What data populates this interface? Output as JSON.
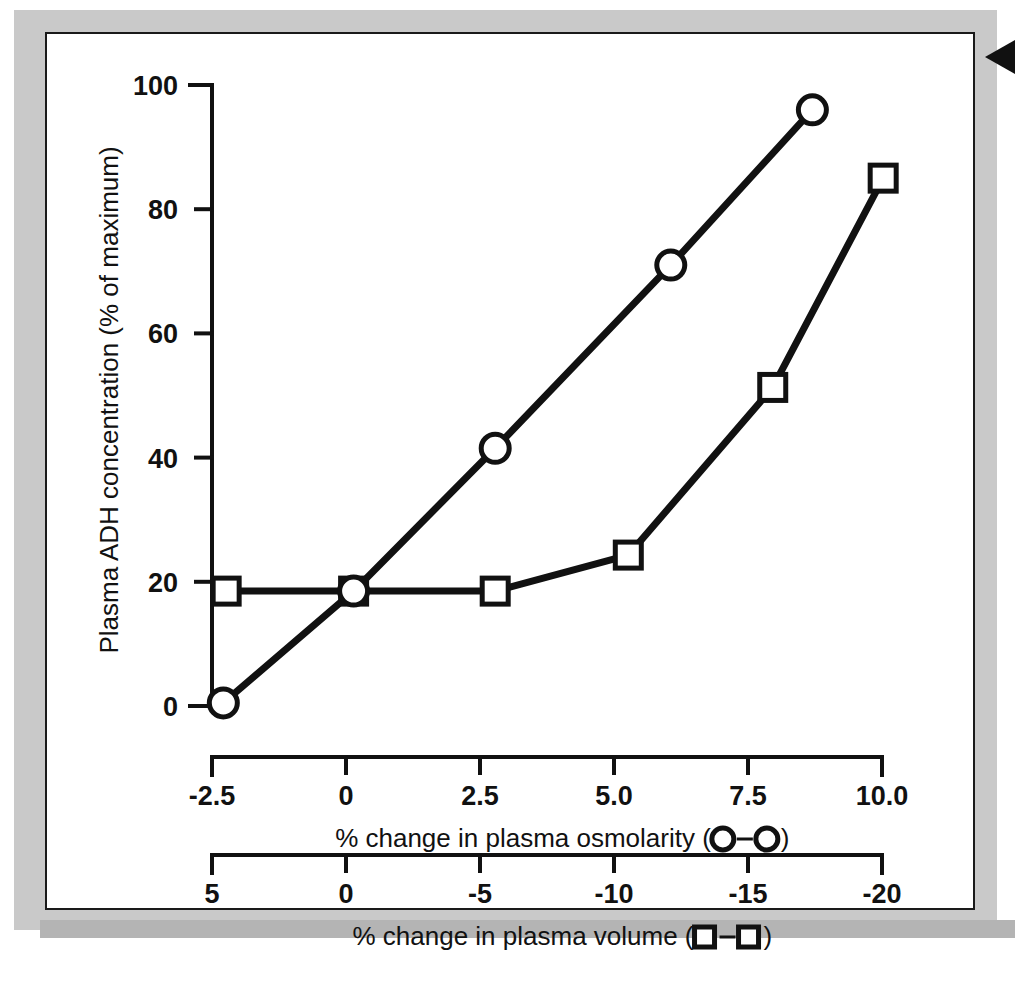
{
  "figure": {
    "arrow_marker": "arrow-marker",
    "frame_color": "#1a1a1a",
    "mount_color": "#c9c9c9",
    "plot_background": "#ffffff",
    "ink_color": "#111111"
  },
  "chart_data": {
    "type": "line",
    "title": "",
    "ylabel": "Plasma ADH concentration (% of maximum)",
    "ylim": [
      0,
      100
    ],
    "yticks": [
      0,
      20,
      40,
      60,
      80,
      100
    ],
    "yticklabels": [
      "0",
      "20",
      "40",
      "60",
      "80",
      "100"
    ],
    "grid": false,
    "legend": "inline-in-axis-titles",
    "axes": [
      {
        "id": "osmolarity",
        "label": "% change in plasma osmolarity (O−O)",
        "label_prefix": "% change in plasma osmolarity (",
        "label_suffix": ")",
        "marker_glyph": "–",
        "marker_shape": "circle",
        "xlim": [
          -2.5,
          10.0
        ],
        "ticks": [
          -2.5,
          0,
          2.5,
          5.0,
          7.5,
          10.0
        ],
        "ticklabels": [
          "-2.5",
          "0",
          "2.5",
          "5.0",
          "7.5",
          "10.0"
        ]
      },
      {
        "id": "volume",
        "label": "% change in plasma volume (□−□)",
        "label_prefix": "% change in plasma volume (",
        "label_suffix": ")",
        "marker_glyph": "–",
        "marker_shape": "square",
        "xlim": [
          5,
          -20
        ],
        "ticks": [
          5,
          0,
          -5,
          -10,
          -15,
          -20
        ],
        "ticklabels": [
          "5",
          "0",
          "-5",
          "-10",
          "-15",
          "-20"
        ]
      }
    ],
    "series": [
      {
        "name": "% change in plasma osmolarity",
        "marker": "circle",
        "axis": "osmolarity",
        "x": [
          -2.3,
          0.0,
          2.5,
          5.6,
          8.1
        ],
        "values": [
          0.5,
          18.5,
          41.5,
          71.0,
          96.0
        ]
      },
      {
        "name": "% change in plasma volume",
        "marker": "square",
        "axis": "volume",
        "x": [
          4.5,
          0.0,
          -5.0,
          -9.7,
          -14.8,
          -18.7
        ],
        "values": [
          18.5,
          18.5,
          18.5,
          24.3,
          51.3,
          85.0
        ]
      }
    ]
  }
}
